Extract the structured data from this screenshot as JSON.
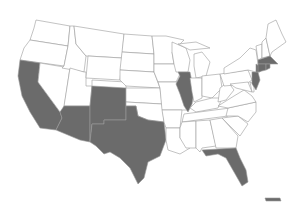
{
  "map": {
    "title": "",
    "highlight_color": "#6b6b6b",
    "base_color": "#ffffff",
    "border_color": "#9a9a9a",
    "highlighted_states": [
      "California",
      "Arizona",
      "New Mexico",
      "Texas",
      "Illinois",
      "Florida",
      "New Jersey",
      "New York",
      "Connecticut",
      "Rhode Island",
      "Massachusetts",
      "Hawaii"
    ],
    "other_states": [
      "Washington",
      "Oregon",
      "Idaho",
      "Nevada",
      "Utah",
      "Montana",
      "Wyoming",
      "Colorado",
      "North Dakota",
      "South Dakota",
      "Nebraska",
      "Kansas",
      "Oklahoma",
      "Minnesota",
      "Iowa",
      "Missouri",
      "Arkansas",
      "Louisiana",
      "Wisconsin",
      "Michigan",
      "Indiana",
      "Ohio",
      "Kentucky",
      "Tennessee",
      "Mississippi",
      "Alabama",
      "Georgia",
      "South Carolina",
      "North Carolina",
      "Virginia",
      "West Virginia",
      "Pennsylvania",
      "Maryland",
      "Delaware",
      "Vermont",
      "New Hampshire",
      "Maine"
    ]
  }
}
